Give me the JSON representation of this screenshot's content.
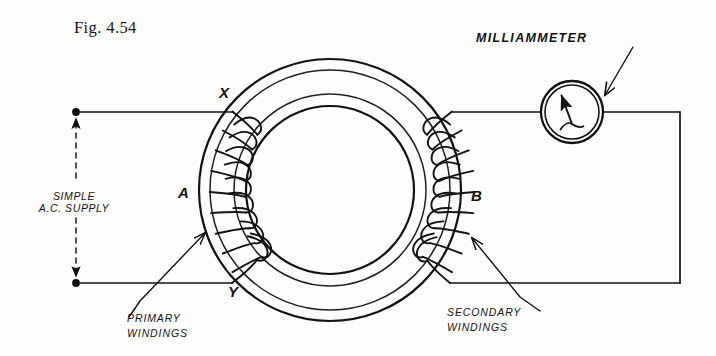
{
  "figure": {
    "caption": "Fig. 4.54",
    "type": "toroidal-transformer-schematic"
  },
  "labels": {
    "node_x": "X",
    "node_y": "Y",
    "node_a": "A",
    "node_b": "B",
    "supply": "SIMPLE\nA.C. SUPPLY",
    "supply_line1": "SIMPLE",
    "supply_line2": "A.C. SUPPLY",
    "primary_line1": "PRIMARY",
    "primary_line2": "WINDINGS",
    "secondary_line1": "SECONDARY",
    "secondary_line2": "WINDINGS",
    "milliammeter": "MILLIAMMETER"
  },
  "colors": {
    "ink": "#121212",
    "paper": "#fdfdfc"
  },
  "geometry": {
    "toroid_center_x": 330,
    "toroid_center_y": 190,
    "outer_radius": 131,
    "inner_radius": 84,
    "ring_band_outer": 120,
    "ring_band_inner": 96,
    "top_wire_y": 112,
    "bottom_wire_y": 283,
    "left_terminal_x": 76,
    "right_wire_x": 680,
    "meter_center_x": 572,
    "meter_center_y": 112,
    "meter_radius": 31
  }
}
